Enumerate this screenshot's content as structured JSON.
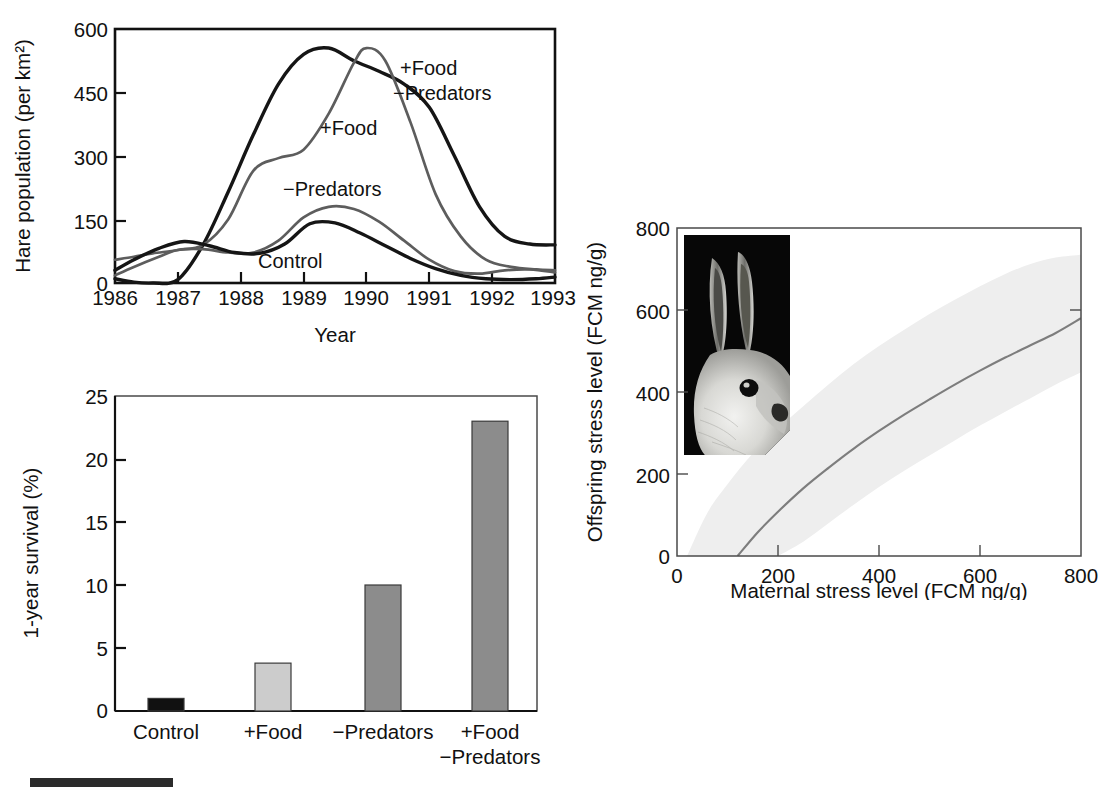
{
  "figure": {
    "background_color": "#ffffff",
    "panels": [
      "hare-population-timeseries",
      "one-year-survival-bars",
      "maternal-offspring-stress-regression"
    ]
  },
  "bottom_rule": {
    "name": "scale-bar",
    "color": "#2b2b2b"
  },
  "chart_data": [
    {
      "id": "hare-population-timeseries",
      "type": "line",
      "title": "",
      "xlabel": "Year",
      "ylabel": "Hare population (per km²)",
      "xlim": [
        1986,
        1993
      ],
      "ylim": [
        0,
        600
      ],
      "xticks": [
        "1986",
        "1987",
        "1988",
        "1989",
        "1990",
        "1991",
        "1992",
        "1993"
      ],
      "yticks": [
        "0",
        "150",
        "300",
        "450",
        "600"
      ],
      "grid": false,
      "legend_position": "inline-annotations",
      "annotations": [
        {
          "text": "+Food",
          "line1": "+Food",
          "line2": "−Predators",
          "x": 1991.0,
          "y": 500
        },
        {
          "text": "+Food",
          "x": 1989.6,
          "y": 370
        },
        {
          "text": "−Predators",
          "x": 1989.4,
          "y": 215
        },
        {
          "text": "Control",
          "x": 1989.5,
          "y": 80
        }
      ],
      "series": [
        {
          "name": "+Food −Predators",
          "color": "#151515",
          "x": [
            1986,
            1986.3,
            1986.6,
            1987.0,
            1987.4,
            1987.8,
            1988.2,
            1988.6,
            1989.0,
            1989.4,
            1989.8,
            1990.2,
            1990.6,
            1991.0,
            1991.4,
            1991.8,
            1992.2,
            1992.6,
            1993.0
          ],
          "values": [
            10,
            2,
            0,
            8,
            90,
            215,
            350,
            470,
            540,
            555,
            525,
            500,
            470,
            415,
            300,
            180,
            110,
            92,
            90
          ]
        },
        {
          "name": "+Food",
          "color": "#5d5d5d",
          "x": [
            1986,
            1986.3,
            1986.6,
            1987.0,
            1987.4,
            1987.8,
            1988.2,
            1988.6,
            1989.0,
            1989.4,
            1989.8,
            1990.0,
            1990.3,
            1990.7,
            1991.1,
            1991.5,
            1991.9,
            1992.3,
            1992.7,
            1993.0
          ],
          "values": [
            55,
            62,
            70,
            78,
            90,
            150,
            265,
            295,
            315,
            400,
            520,
            555,
            525,
            380,
            210,
            110,
            55,
            38,
            32,
            30
          ]
        },
        {
          "name": "−Predators",
          "color": "#5d5d5d",
          "x": [
            1986,
            1986.3,
            1986.7,
            1987.0,
            1987.4,
            1987.8,
            1988.2,
            1988.6,
            1989.0,
            1989.4,
            1989.8,
            1990.2,
            1990.6,
            1991.0,
            1991.4,
            1991.8,
            1992.2,
            1992.6,
            1993.0
          ],
          "values": [
            18,
            38,
            62,
            78,
            80,
            72,
            72,
            100,
            155,
            180,
            175,
            145,
            100,
            55,
            28,
            22,
            30,
            32,
            25
          ]
        },
        {
          "name": "Control",
          "color": "#151515",
          "x": [
            1986,
            1986.3,
            1986.7,
            1987.1,
            1987.5,
            1987.9,
            1988.3,
            1988.7,
            1989.1,
            1989.5,
            1989.9,
            1990.3,
            1990.7,
            1991.1,
            1991.5,
            1991.9,
            1992.3,
            1992.7,
            1993.0
          ],
          "values": [
            30,
            55,
            82,
            98,
            88,
            72,
            70,
            92,
            140,
            142,
            118,
            88,
            58,
            34,
            18,
            10,
            8,
            10,
            14
          ]
        }
      ]
    },
    {
      "id": "one-year-survival-bars",
      "type": "bar",
      "title": "",
      "xlabel": "",
      "ylabel": "1-year survival (%)",
      "ylim": [
        0,
        25
      ],
      "yticks": [
        "0",
        "5",
        "10",
        "15",
        "20",
        "25"
      ],
      "grid": false,
      "categories": [
        "Control",
        "+Food",
        "−Predators",
        "+Food\n−Predators"
      ],
      "category_labels": [
        {
          "line1": "Control",
          "line2": ""
        },
        {
          "line1": "+Food",
          "line2": ""
        },
        {
          "line1": "−Predators",
          "line2": ""
        },
        {
          "line1": "+Food",
          "line2": "−Predators"
        }
      ],
      "values": [
        1.0,
        3.8,
        10.0,
        23.0
      ],
      "bar_colors": [
        "#111111",
        "#cccccc",
        "#8c8c8c",
        "#8c8c8c"
      ]
    },
    {
      "id": "maternal-offspring-stress-regression",
      "type": "line",
      "title": "",
      "xlabel": "Maternal stress level (FCM ng/g)",
      "ylabel": "Offspring stress level (FCM ng/g)",
      "xlim": [
        0,
        800
      ],
      "ylim": [
        0,
        800
      ],
      "xticks": [
        "0",
        "200",
        "400",
        "600",
        "800"
      ],
      "yticks": [
        "0",
        "200",
        "400",
        "600",
        "800"
      ],
      "grid": false,
      "band_color": "#eeeeee",
      "line_color": "#7d7d7d",
      "series": [
        {
          "name": "fitted regression",
          "x": [
            120,
            160,
            200,
            250,
            300,
            350,
            400,
            450,
            500,
            550,
            600,
            650,
            700,
            750,
            800
          ],
          "values": [
            0,
            58,
            108,
            165,
            215,
            262,
            305,
            345,
            382,
            418,
            452,
            484,
            514,
            544,
            580
          ]
        },
        {
          "name": "upper 95% CI",
          "x": [
            20,
            60,
            100,
            150,
            200,
            250,
            300,
            350,
            400,
            450,
            500,
            550,
            600,
            650,
            700,
            750,
            800
          ],
          "values": [
            0,
            105,
            175,
            250,
            310,
            365,
            418,
            468,
            512,
            552,
            590,
            625,
            658,
            688,
            712,
            728,
            735
          ]
        },
        {
          "name": "lower 95% CI",
          "x": [
            200,
            250,
            300,
            350,
            400,
            450,
            500,
            550,
            600,
            650,
            700,
            750,
            800
          ],
          "values": [
            0,
            35,
            80,
            125,
            168,
            208,
            245,
            282,
            318,
            352,
            385,
            418,
            448
          ]
        }
      ],
      "inset": {
        "name": "snowshoe-hare-photo",
        "description": "Snowshoe hare head, white winter coat, on black background"
      }
    }
  ]
}
